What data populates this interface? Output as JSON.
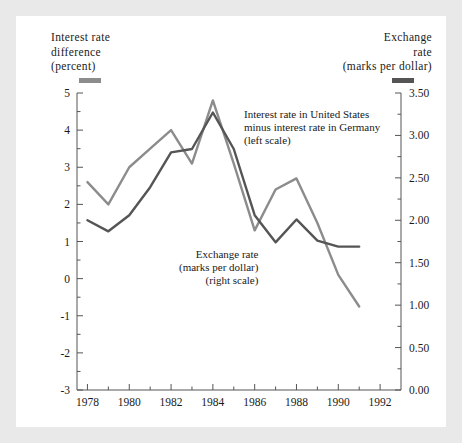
{
  "figure": {
    "background": "#ffffff",
    "page_background": "#e9e9e9"
  },
  "left_axis_caption": {
    "line1": "Interest rate",
    "line2": "difference",
    "line3": "(percent)",
    "swatch_color": "#8c8c8c"
  },
  "right_axis_caption": {
    "line1": "Exchange",
    "line2": "rate",
    "line3": "(marks per dollar)",
    "swatch_color": "#555555"
  },
  "annotations": {
    "interest": {
      "line1": "Interest rate in United States",
      "line2": "minus interest rate in Germany",
      "line3": "(left scale)"
    },
    "exchange": {
      "line1": "Exchange rate",
      "line2": "(marks per dollar)",
      "line3": "(right scale)"
    }
  },
  "chart_data": {
    "type": "line",
    "title": "",
    "xlabel": "",
    "ylabel": "Interest rate difference (percent)",
    "y2label": "Exchange rate (marks per dollar)",
    "grid": false,
    "legend_position": "inline-annotations",
    "xlim": [
      1977.5,
      1993.0
    ],
    "x_ticks": [
      1978,
      1980,
      1982,
      1984,
      1986,
      1988,
      1990,
      1992
    ],
    "x_tick_labels": [
      "1978",
      "1980",
      "1982",
      "1984",
      "1986",
      "1988",
      "1990",
      "1992"
    ],
    "x_minor_ticks": [
      1979,
      1981,
      1983,
      1985,
      1987,
      1989,
      1991
    ],
    "ylim": [
      -3,
      5
    ],
    "y_ticks": [
      5,
      4,
      3,
      2,
      1,
      0,
      -1,
      -2,
      -3
    ],
    "y_tick_labels": [
      "5",
      "4",
      "3",
      "2",
      "1",
      "0",
      "-1",
      "-2",
      "-3"
    ],
    "y_minor_ticks": [
      4.5,
      3.5,
      2.5,
      1.5,
      0.5,
      -0.5,
      -1.5,
      -2.5
    ],
    "y2lim": [
      0.0,
      3.5
    ],
    "y2_ticks": [
      3.5,
      3.0,
      2.5,
      2.0,
      1.5,
      1.0,
      0.5,
      0.0
    ],
    "y2_tick_labels": [
      "3.50",
      "3.00",
      "2.50",
      "2.00",
      "1.50",
      "1.00",
      "0.50",
      "0.00"
    ],
    "y2_minor_ticks": [
      3.25,
      2.75,
      2.25,
      1.75,
      1.25,
      0.75,
      0.25
    ],
    "x": [
      1978,
      1979,
      1980,
      1981,
      1982,
      1983,
      1984,
      1985,
      1986,
      1987,
      1988,
      1989,
      1990,
      1991
    ],
    "series": [
      {
        "name": "Interest rate in United States minus interest rate in Germany (left scale)",
        "axis": "left",
        "color": "#8c8c8c",
        "values": [
          2.6,
          2.0,
          3.0,
          3.5,
          4.0,
          3.1,
          4.8,
          3.1,
          1.3,
          2.4,
          2.7,
          1.5,
          0.1,
          -0.75
        ]
      },
      {
        "name": "Exchange rate (marks per dollar) (right scale)",
        "axis": "right",
        "color": "#555555",
        "values_left_equivalent": [
          1.15,
          0.85,
          1.3,
          2.05,
          3.0,
          3.1,
          4.1,
          3.1,
          1.3,
          0.55,
          1.2,
          0.6,
          0.45,
          0.45
        ],
        "values": [
          2.0,
          1.87,
          2.06,
          2.39,
          2.8,
          2.84,
          3.27,
          2.84,
          2.06,
          1.74,
          2.01,
          1.76,
          1.69,
          1.69
        ]
      }
    ]
  }
}
